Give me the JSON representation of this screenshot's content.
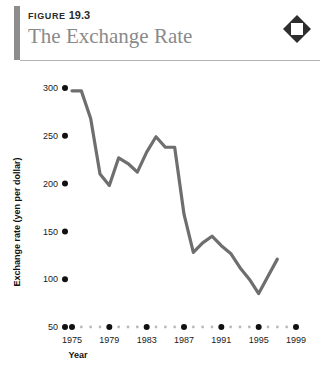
{
  "header": {
    "eyebrow_label": "FIGURE",
    "eyebrow_number": "19.3",
    "title": "The Exchange Rate",
    "icon": "diamond-icon",
    "accent_color": "#8d8d8d",
    "title_color": "#8a8a8a",
    "rule_color": "#b4b4b4"
  },
  "chart_data": {
    "type": "line",
    "title": "The Exchange Rate",
    "xlabel": "Year",
    "ylabel": "Exchange rate (yen per dollar)",
    "xlim": [
      1975,
      1999
    ],
    "ylim": [
      50,
      300
    ],
    "grid": false,
    "legend": "none",
    "line_color": "#6e6e6e",
    "y_ticks": [
      300,
      250,
      200,
      150,
      100,
      50
    ],
    "x_ticks": [
      1975,
      1979,
      1983,
      1987,
      1991,
      1995,
      1999
    ],
    "x_minor_step": 1,
    "x": [
      1975,
      1976,
      1977,
      1978,
      1979,
      1980,
      1981,
      1982,
      1983,
      1984,
      1985,
      1986,
      1987,
      1988,
      1989,
      1990,
      1991,
      1992,
      1993,
      1994,
      1995,
      1996,
      1997
    ],
    "values": [
      297,
      297,
      268,
      210,
      198,
      227,
      221,
      212,
      233,
      249,
      238,
      238,
      168,
      128,
      138,
      145,
      135,
      127,
      112,
      100,
      85,
      103,
      121
    ]
  }
}
